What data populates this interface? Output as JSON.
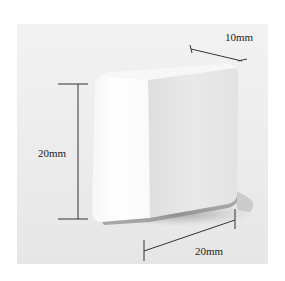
{
  "figure": {
    "dimensions": {
      "depth_label": "10mm",
      "height_label": "20mm",
      "width_label": "20mm"
    },
    "colors": {
      "background": "#ffffff",
      "panel": "#ececec",
      "block_front": "#fdfdfd",
      "block_side": "#e4e4e4",
      "dimension_line": "#333333"
    }
  }
}
